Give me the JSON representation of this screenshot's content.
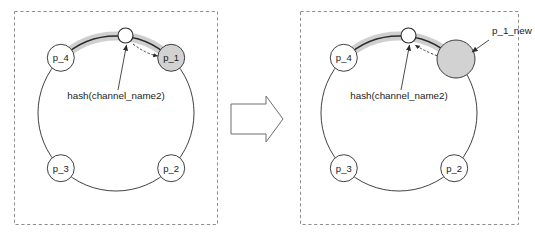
{
  "figure": {
    "colors": {
      "node_fill_plain": "#ffffff",
      "node_fill_gray": "#d2d2d2",
      "stroke": "#2b2b2b",
      "panel_border": "#8f8f8f",
      "arc_highlight": "#cfcfcf",
      "background": "#ffffff"
    }
  },
  "transition": {
    "icon": "block-arrow-right-icon",
    "direction": "right"
  },
  "panels": [
    {
      "id": "before",
      "nodes": [
        {
          "id": "p_1",
          "label": "p_1",
          "fill": "gray",
          "radius": 13.5,
          "angle_deg": 45
        },
        {
          "id": "p_2",
          "label": "p_2",
          "fill": "white",
          "radius": 13.5,
          "angle_deg": 315
        },
        {
          "id": "p_3",
          "label": "p_3",
          "fill": "white",
          "radius": 13.5,
          "angle_deg": 225
        },
        {
          "id": "p_4",
          "label": "p_4",
          "fill": "white",
          "radius": 13.5,
          "angle_deg": 135
        }
      ],
      "hash_marker": {
        "id": "hash_channel_name2",
        "label": "hash(channel_name2)",
        "angle_deg": 83,
        "radius": 7.5
      },
      "highlight_arc": {
        "from_angle_deg": 135,
        "to_angle_deg": 45
      },
      "assignment_arrow": {
        "from": "hash_channel_name2",
        "to": "p_1",
        "style": "dashed"
      },
      "callouts": []
    },
    {
      "id": "after",
      "nodes": [
        {
          "id": "p_1_new",
          "label": "",
          "fill": "gray",
          "radius": 19,
          "angle_deg": 45
        },
        {
          "id": "p_2",
          "label": "p_2",
          "fill": "white",
          "radius": 13.5,
          "angle_deg": 315
        },
        {
          "id": "p_3",
          "label": "p_3",
          "fill": "white",
          "radius": 13.5,
          "angle_deg": 225
        },
        {
          "id": "p_4",
          "label": "p_4",
          "fill": "white",
          "radius": 13.5,
          "angle_deg": 135
        }
      ],
      "hash_marker": {
        "id": "hash_channel_name2",
        "label": "hash(channel_name2)",
        "angle_deg": 83,
        "radius": 7.5
      },
      "highlight_arc": {
        "from_angle_deg": 135,
        "to_angle_deg": 45
      },
      "assignment_arrow": {
        "from": "p_1_new",
        "to": "hash_channel_name2",
        "style": "dashed"
      },
      "callouts": [
        {
          "id": "p_1_new_callout",
          "label": "p_1_new",
          "target": "p_1_new"
        }
      ]
    }
  ]
}
